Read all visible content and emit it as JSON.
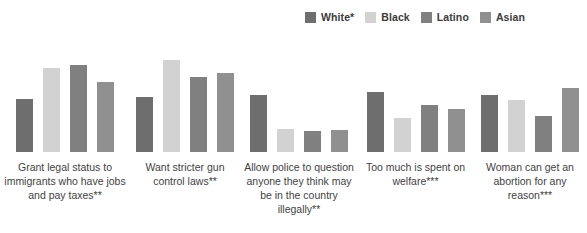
{
  "legend": {
    "position": "top-right",
    "items": [
      {
        "label": "White*",
        "color": "#6e6e6e"
      },
      {
        "label": "Black",
        "color": "#d2d2d2"
      },
      {
        "label": "Latino",
        "color": "#808080"
      },
      {
        "label": "Asian",
        "color": "#909090"
      }
    ]
  },
  "chart_data": {
    "type": "bar",
    "title": "",
    "xlabel": "",
    "ylabel": "",
    "ylim": [
      0,
      100
    ],
    "grid": false,
    "value_suffix": "%",
    "categories": [
      "Grant legal status to immigrants who have jobs and pay taxes**",
      "Want stricter gun control laws**",
      "Allow police to question anyone they think may be in the country illegally**",
      "Too much is spent on welfare***",
      "Woman can get an abortion for any reason***"
    ],
    "series": [
      {
        "name": "White*",
        "color": "#6e6e6e",
        "values": [
          41,
          42,
          44,
          46,
          44
        ],
        "labels": [
          "41%",
          "42%",
          "44%",
          "46%",
          "44%"
        ]
      },
      {
        "name": "Black",
        "color": "#d2d2d2",
        "values": [
          65,
          71,
          18,
          26,
          40
        ],
        "labels": [
          "65%",
          "71%",
          "18%",
          "26%",
          "40%"
        ]
      },
      {
        "name": "Latino",
        "color": "#808080",
        "values": [
          67,
          58,
          16,
          36,
          28
        ],
        "labels": [
          "67%",
          "58%",
          "16%",
          "36%",
          "28%"
        ]
      },
      {
        "name": "Asian",
        "color": "#909090",
        "values": [
          54,
          61,
          17,
          33,
          49
        ],
        "labels": [
          "54%",
          "61%",
          "17%",
          "33%",
          "49%"
        ]
      }
    ]
  }
}
